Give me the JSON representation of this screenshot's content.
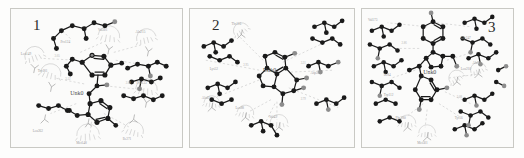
{
  "figure": {
    "type": "ligand-interaction-diagram-panels",
    "panel_count": 3,
    "background_color": "#fdfdfc",
    "panel_background_color": "#fbfbfa",
    "panel_border_color": "#c9c9c4",
    "atom_carbon_color": "#1a1a1a",
    "atom_hetero_color": "#8d8d8d",
    "bond_color": "#1a1a1a",
    "hbond_color": "#bdbdbd",
    "arc_color": "#c2c2c2",
    "label_color": "#9a9a9a",
    "ligand_label_color": "#4a4a4a"
  },
  "panels": [
    {
      "number": "1",
      "ligand_label": "Unk0",
      "residues": [
        "Leu149",
        "Val201",
        "Ala215",
        "Trp181",
        "Phe133",
        "Met148",
        "Ile271",
        "Leu262",
        "Pro124",
        "Gly218",
        "Tyr197",
        "Ser240"
      ],
      "hbond_labels": [
        "3.05",
        "2.88",
        "3.12"
      ]
    },
    {
      "number": "2",
      "ligand_label": "Unk0",
      "residues": [
        "Thr116",
        "Leu88",
        "Val45",
        "Ala61",
        "Asp205",
        "Lys52",
        "Gly92",
        "Ile155"
      ],
      "hbond_labels": [
        "2.95",
        "3.21",
        "2.79"
      ]
    },
    {
      "number": "3",
      "ligand_label": "Unk0",
      "residues": [
        "Val173",
        "Leu210",
        "Ala99",
        "Phe286",
        "Met301",
        "Ile84",
        "Trp112",
        "Gly247",
        "Tyr56",
        "Pro190",
        "Leu330",
        "Ser121"
      ],
      "hbond_labels": [
        "2.86",
        "3.08"
      ]
    }
  ]
}
